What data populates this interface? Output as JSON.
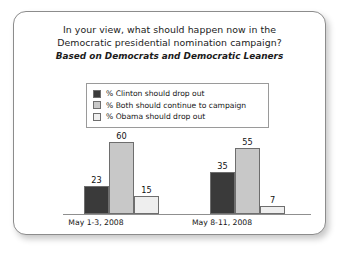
{
  "title_lines": [
    "In your view, what should happen now in the",
    "Democratic presidential nomination campaign?"
  ],
  "subtitle": "Based on Democrats and Democratic Leaners",
  "legend": [
    {
      "label": "% Clinton should drop out",
      "color": "#3a3a3a"
    },
    {
      "label": "% Both should continue to campaign",
      "color": "#c8c8c8"
    },
    {
      "label": "% Obama should drop out",
      "color": "#eeeeee"
    }
  ],
  "chart_data": {
    "type": "bar",
    "title": "In your view, what should happen now in the Democratic presidential nomination campaign?",
    "subtitle": "Based on Democrats and Democratic Leaners",
    "categories": [
      "May 1-3, 2008",
      "May 8-11, 2008"
    ],
    "series": [
      {
        "name": "% Clinton should drop out",
        "color": "#3a3a3a",
        "values": [
          23,
          35
        ]
      },
      {
        "name": "% Both should continue to campaign",
        "color": "#c8c8c8",
        "values": [
          60,
          55
        ]
      },
      {
        "name": "% Obama should drop out",
        "color": "#eeeeee",
        "values": [
          15,
          7
        ]
      }
    ],
    "xlabel": "",
    "ylabel": "",
    "ylim": [
      0,
      65
    ],
    "grid": false,
    "legend_position": "top-center"
  }
}
